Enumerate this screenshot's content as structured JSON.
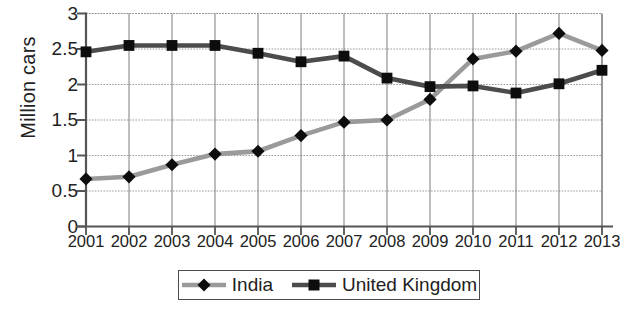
{
  "chart_data": {
    "type": "line",
    "title": "",
    "xlabel": "",
    "ylabel": "Million cars",
    "categories": [
      "2001",
      "2002",
      "2003",
      "2004",
      "2005",
      "2006",
      "2007",
      "2008",
      "2009",
      "2010",
      "2011",
      "2012",
      "2013"
    ],
    "ylim": [
      0,
      3
    ],
    "yticks": [
      "0",
      "0.5",
      "1",
      "1.5",
      "2",
      "2.5",
      "3"
    ],
    "ytick_values": [
      0,
      0.5,
      1,
      1.5,
      2,
      2.5,
      3
    ],
    "grid": true,
    "legend_position": "bottom",
    "series": [
      {
        "name": "India",
        "color": "#9a9a9a",
        "marker": "diamond",
        "marker_color": "#0d0d0d",
        "values": [
          0.67,
          0.7,
          0.87,
          1.02,
          1.06,
          1.28,
          1.47,
          1.5,
          1.79,
          2.36,
          2.47,
          2.72,
          2.48
        ]
      },
      {
        "name": "United Kingdom",
        "color": "#4c4c4c",
        "marker": "square",
        "marker_color": "#0d0d0d",
        "values": [
          2.46,
          2.55,
          2.55,
          2.55,
          2.44,
          2.32,
          2.4,
          2.09,
          1.97,
          1.98,
          1.88,
          2.01,
          2.2
        ]
      }
    ]
  },
  "legend": {
    "items": [
      {
        "label": "India"
      },
      {
        "label": "United Kingdom"
      }
    ]
  },
  "axes": {
    "y_title": "Million cars"
  },
  "colors": {
    "india_line": "#9a9a9a",
    "uk_line": "#4c4c4c",
    "marker": "#0d0d0d",
    "axis": "#555555",
    "grid": "#8f8f8f",
    "background": "#ffffff"
  }
}
